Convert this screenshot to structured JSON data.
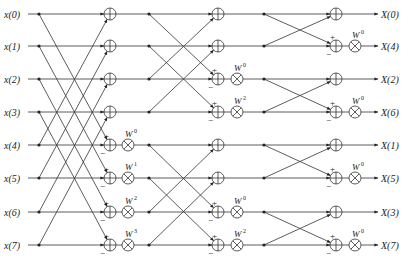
{
  "inputs": [
    "x(0)",
    "x(1)",
    "x(2)",
    "x(3)",
    "x(4)",
    "x(5)",
    "x(6)",
    "x(7)"
  ],
  "outputs": [
    "X(0)",
    "X(4)",
    "X(2)",
    "X(6)",
    "X(1)",
    "X(5)",
    "X(3)",
    "X(7)"
  ],
  "row_y": [
    14,
    46,
    79,
    112,
    145,
    178,
    212,
    245
  ],
  "stages": [
    {
      "name": "stage-1",
      "dot_x": 39,
      "adder_x": 110,
      "mult_x": 128,
      "pairs": [
        [
          0,
          4
        ],
        [
          1,
          5
        ],
        [
          2,
          6
        ],
        [
          3,
          7
        ]
      ],
      "twiddles": [
        {
          "row": 4,
          "label": "W",
          "exp": "0"
        },
        {
          "row": 5,
          "label": "W",
          "exp": "1"
        },
        {
          "row": 6,
          "label": "W",
          "exp": "2"
        },
        {
          "row": 7,
          "label": "W",
          "exp": "3"
        }
      ]
    },
    {
      "name": "stage-2",
      "dot_x": 149,
      "adder_x": 218,
      "mult_x": 237,
      "pairs": [
        [
          0,
          2
        ],
        [
          1,
          3
        ],
        [
          4,
          6
        ],
        [
          5,
          7
        ]
      ],
      "twiddles": [
        {
          "row": 2,
          "label": "W",
          "exp": "0"
        },
        {
          "row": 3,
          "label": "W",
          "exp": "2"
        },
        {
          "row": 6,
          "label": "W",
          "exp": "0"
        },
        {
          "row": 7,
          "label": "W",
          "exp": "2"
        }
      ]
    },
    {
      "name": "stage-3",
      "dot_x": 264,
      "adder_x": 336,
      "mult_x": 355,
      "pairs": [
        [
          0,
          1
        ],
        [
          2,
          3
        ],
        [
          4,
          5
        ],
        [
          6,
          7
        ]
      ],
      "twiddles": [
        {
          "row": 1,
          "label": "W",
          "exp": "0"
        },
        {
          "row": 3,
          "label": "W",
          "exp": "0"
        },
        {
          "row": 5,
          "label": "W",
          "exp": "0"
        },
        {
          "row": 7,
          "label": "W",
          "exp": "0"
        }
      ]
    }
  ],
  "signs": {
    "plus": "+",
    "minus": "−"
  },
  "symbols": {
    "adder": "circle-plus",
    "multiplier": "circle-times"
  }
}
